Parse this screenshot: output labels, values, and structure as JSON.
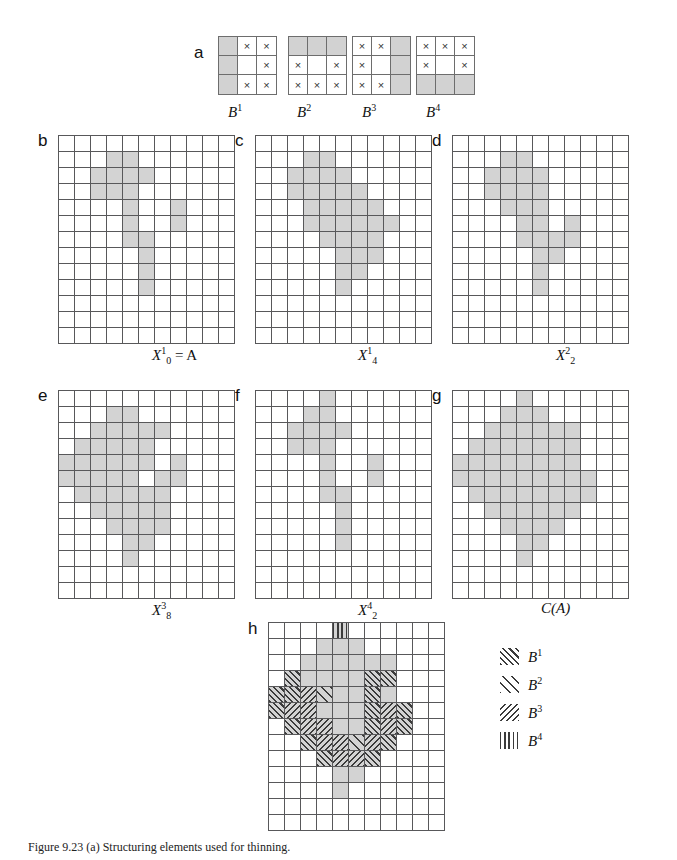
{
  "figure": {
    "caption": "Figure 9.23  (a) Structuring elements used for thinning.",
    "grid": {
      "cols": 11,
      "rows": 13,
      "fill_color": "#d3d3d3",
      "line_color": "#58585a"
    }
  },
  "structuring_elements": {
    "panel_letter": "a",
    "items": [
      {
        "label": "B",
        "sup": "1",
        "cells": [
          "g",
          "x",
          "x",
          "g",
          "",
          "x",
          "g",
          "x",
          "x"
        ]
      },
      {
        "label": "B",
        "sup": "2",
        "cells": [
          "g",
          "g",
          "g",
          "x",
          "",
          "x",
          "x",
          "x",
          "x"
        ]
      },
      {
        "label": "B",
        "sup": "3",
        "cells": [
          "x",
          "x",
          "g",
          "x",
          "",
          "g",
          "x",
          "x",
          "g"
        ]
      },
      {
        "label": "B",
        "sup": "4",
        "cells": [
          "x",
          "x",
          "x",
          "x",
          "",
          "x",
          "g",
          "g",
          "g"
        ]
      }
    ],
    "mark_glyph": "×"
  },
  "panels": [
    {
      "id": "b",
      "letter": "b",
      "caption_parts": {
        "base": "X",
        "sub": "0",
        "sup": "1",
        "tail": " = A"
      },
      "filled": [
        [
          3,
          1
        ],
        [
          4,
          1
        ],
        [
          2,
          2
        ],
        [
          3,
          2
        ],
        [
          4,
          2
        ],
        [
          5,
          2
        ],
        [
          2,
          3
        ],
        [
          3,
          3
        ],
        [
          4,
          3
        ],
        [
          4,
          4
        ],
        [
          7,
          4
        ],
        [
          4,
          5
        ],
        [
          7,
          5
        ],
        [
          4,
          6
        ],
        [
          5,
          6
        ],
        [
          5,
          7
        ],
        [
          5,
          8
        ],
        [
          5,
          9
        ]
      ]
    },
    {
      "id": "c",
      "letter": "c",
      "caption_parts": {
        "base": "X",
        "sub": "4",
        "sup": "1",
        "tail": ""
      },
      "filled": [
        [
          3,
          1
        ],
        [
          4,
          1
        ],
        [
          2,
          2
        ],
        [
          3,
          2
        ],
        [
          4,
          2
        ],
        [
          5,
          2
        ],
        [
          2,
          3
        ],
        [
          3,
          3
        ],
        [
          4,
          3
        ],
        [
          5,
          3
        ],
        [
          6,
          3
        ],
        [
          3,
          4
        ],
        [
          4,
          4
        ],
        [
          5,
          4
        ],
        [
          6,
          4
        ],
        [
          7,
          4
        ],
        [
          3,
          5
        ],
        [
          4,
          5
        ],
        [
          5,
          5
        ],
        [
          6,
          5
        ],
        [
          7,
          5
        ],
        [
          8,
          5
        ],
        [
          4,
          6
        ],
        [
          5,
          6
        ],
        [
          6,
          6
        ],
        [
          7,
          6
        ],
        [
          5,
          7
        ],
        [
          6,
          7
        ],
        [
          7,
          7
        ],
        [
          5,
          8
        ],
        [
          6,
          8
        ],
        [
          5,
          9
        ]
      ]
    },
    {
      "id": "d",
      "letter": "d",
      "caption_parts": {
        "base": "X",
        "sub": "2",
        "sup": "2",
        "tail": ""
      },
      "filled": [
        [
          3,
          1
        ],
        [
          4,
          1
        ],
        [
          2,
          2
        ],
        [
          3,
          2
        ],
        [
          4,
          2
        ],
        [
          5,
          2
        ],
        [
          2,
          3
        ],
        [
          3,
          3
        ],
        [
          4,
          3
        ],
        [
          5,
          3
        ],
        [
          3,
          4
        ],
        [
          4,
          4
        ],
        [
          5,
          4
        ],
        [
          4,
          5
        ],
        [
          5,
          5
        ],
        [
          7,
          5
        ],
        [
          4,
          6
        ],
        [
          5,
          6
        ],
        [
          6,
          6
        ],
        [
          7,
          6
        ],
        [
          5,
          7
        ],
        [
          6,
          7
        ],
        [
          5,
          8
        ],
        [
          5,
          9
        ]
      ]
    },
    {
      "id": "e",
      "letter": "e",
      "caption_parts": {
        "base": "X",
        "sub": "8",
        "sup": "3",
        "tail": ""
      },
      "filled": [
        [
          3,
          1
        ],
        [
          4,
          1
        ],
        [
          2,
          2
        ],
        [
          3,
          2
        ],
        [
          4,
          2
        ],
        [
          5,
          2
        ],
        [
          6,
          2
        ],
        [
          1,
          3
        ],
        [
          2,
          3
        ],
        [
          3,
          3
        ],
        [
          4,
          3
        ],
        [
          5,
          3
        ],
        [
          0,
          4
        ],
        [
          1,
          4
        ],
        [
          2,
          4
        ],
        [
          3,
          4
        ],
        [
          4,
          4
        ],
        [
          5,
          4
        ],
        [
          7,
          4
        ],
        [
          0,
          5
        ],
        [
          1,
          5
        ],
        [
          2,
          5
        ],
        [
          3,
          5
        ],
        [
          4,
          5
        ],
        [
          6,
          5
        ],
        [
          7,
          5
        ],
        [
          1,
          6
        ],
        [
          2,
          6
        ],
        [
          3,
          6
        ],
        [
          4,
          6
        ],
        [
          5,
          6
        ],
        [
          6,
          6
        ],
        [
          2,
          7
        ],
        [
          3,
          7
        ],
        [
          4,
          7
        ],
        [
          5,
          7
        ],
        [
          6,
          7
        ],
        [
          3,
          8
        ],
        [
          4,
          8
        ],
        [
          5,
          8
        ],
        [
          6,
          8
        ],
        [
          4,
          9
        ],
        [
          5,
          9
        ],
        [
          4,
          10
        ]
      ]
    },
    {
      "id": "f",
      "letter": "f",
      "caption_parts": {
        "base": "X",
        "sub": "2",
        "sup": "4",
        "tail": ""
      },
      "filled": [
        [
          4,
          0
        ],
        [
          3,
          1
        ],
        [
          4,
          1
        ],
        [
          2,
          2
        ],
        [
          3,
          2
        ],
        [
          4,
          2
        ],
        [
          5,
          2
        ],
        [
          2,
          3
        ],
        [
          3,
          3
        ],
        [
          4,
          3
        ],
        [
          4,
          4
        ],
        [
          7,
          4
        ],
        [
          4,
          5
        ],
        [
          7,
          5
        ],
        [
          4,
          6
        ],
        [
          5,
          6
        ],
        [
          5,
          7
        ],
        [
          5,
          8
        ],
        [
          5,
          9
        ]
      ]
    },
    {
      "id": "g",
      "letter": "g",
      "caption_parts": {
        "base": "C(A)",
        "sub": "",
        "sup": "",
        "tail": ""
      },
      "filled": [
        [
          4,
          0
        ],
        [
          3,
          1
        ],
        [
          4,
          1
        ],
        [
          5,
          1
        ],
        [
          2,
          2
        ],
        [
          3,
          2
        ],
        [
          4,
          2
        ],
        [
          5,
          2
        ],
        [
          6,
          2
        ],
        [
          7,
          2
        ],
        [
          1,
          3
        ],
        [
          2,
          3
        ],
        [
          3,
          3
        ],
        [
          4,
          3
        ],
        [
          5,
          3
        ],
        [
          6,
          3
        ],
        [
          7,
          3
        ],
        [
          0,
          4
        ],
        [
          1,
          4
        ],
        [
          2,
          4
        ],
        [
          3,
          4
        ],
        [
          4,
          4
        ],
        [
          5,
          4
        ],
        [
          6,
          4
        ],
        [
          7,
          4
        ],
        [
          0,
          5
        ],
        [
          1,
          5
        ],
        [
          2,
          5
        ],
        [
          3,
          5
        ],
        [
          4,
          5
        ],
        [
          5,
          5
        ],
        [
          6,
          5
        ],
        [
          7,
          5
        ],
        [
          8,
          5
        ],
        [
          1,
          6
        ],
        [
          2,
          6
        ],
        [
          3,
          6
        ],
        [
          4,
          6
        ],
        [
          5,
          6
        ],
        [
          6,
          6
        ],
        [
          7,
          6
        ],
        [
          8,
          6
        ],
        [
          2,
          7
        ],
        [
          3,
          7
        ],
        [
          4,
          7
        ],
        [
          5,
          7
        ],
        [
          6,
          7
        ],
        [
          7,
          7
        ],
        [
          3,
          8
        ],
        [
          4,
          8
        ],
        [
          5,
          8
        ],
        [
          6,
          8
        ],
        [
          4,
          9
        ],
        [
          5,
          9
        ],
        [
          4,
          10
        ]
      ]
    }
  ],
  "panel_h": {
    "letter": "h",
    "filled": [
      [
        4,
        0
      ],
      [
        3,
        1
      ],
      [
        4,
        1
      ],
      [
        5,
        1
      ],
      [
        2,
        2
      ],
      [
        3,
        2
      ],
      [
        4,
        2
      ],
      [
        5,
        2
      ],
      [
        6,
        2
      ],
      [
        7,
        2
      ],
      [
        1,
        3
      ],
      [
        2,
        3
      ],
      [
        3,
        3
      ],
      [
        4,
        3
      ],
      [
        5,
        3
      ],
      [
        6,
        3
      ],
      [
        7,
        3
      ],
      [
        0,
        4
      ],
      [
        1,
        4
      ],
      [
        2,
        4
      ],
      [
        3,
        4
      ],
      [
        4,
        4
      ],
      [
        5,
        4
      ],
      [
        6,
        4
      ],
      [
        7,
        4
      ],
      [
        0,
        5
      ],
      [
        1,
        5
      ],
      [
        2,
        5
      ],
      [
        3,
        5
      ],
      [
        4,
        5
      ],
      [
        5,
        5
      ],
      [
        6,
        5
      ],
      [
        7,
        5
      ],
      [
        8,
        5
      ],
      [
        1,
        6
      ],
      [
        2,
        6
      ],
      [
        3,
        6
      ],
      [
        4,
        6
      ],
      [
        5,
        6
      ],
      [
        6,
        6
      ],
      [
        7,
        6
      ],
      [
        8,
        6
      ],
      [
        2,
        7
      ],
      [
        3,
        7
      ],
      [
        4,
        7
      ],
      [
        5,
        7
      ],
      [
        6,
        7
      ],
      [
        7,
        7
      ],
      [
        3,
        8
      ],
      [
        4,
        8
      ],
      [
        5,
        8
      ],
      [
        6,
        8
      ],
      [
        4,
        9
      ],
      [
        5,
        9
      ],
      [
        4,
        10
      ]
    ],
    "hatch": {
      "h1": [
        [
          1,
          3
        ],
        [
          6,
          3
        ],
        [
          7,
          3
        ],
        [
          0,
          4
        ],
        [
          1,
          4
        ],
        [
          2,
          4
        ],
        [
          6,
          4
        ],
        [
          0,
          5
        ],
        [
          1,
          5
        ],
        [
          2,
          5
        ],
        [
          6,
          5
        ],
        [
          7,
          5
        ],
        [
          8,
          5
        ],
        [
          1,
          6
        ],
        [
          2,
          6
        ],
        [
          3,
          6
        ],
        [
          6,
          6
        ],
        [
          7,
          6
        ],
        [
          8,
          6
        ],
        [
          2,
          7
        ],
        [
          3,
          7
        ],
        [
          4,
          7
        ],
        [
          6,
          7
        ],
        [
          7,
          7
        ],
        [
          3,
          8
        ],
        [
          4,
          8
        ],
        [
          5,
          8
        ],
        [
          6,
          8
        ]
      ],
      "h2": [
        [
          3,
          4
        ],
        [
          5,
          7
        ]
      ],
      "h3": [
        [
          2,
          4
        ],
        [
          1,
          5
        ],
        [
          2,
          5
        ],
        [
          7,
          5
        ],
        [
          2,
          6
        ],
        [
          3,
          6
        ],
        [
          7,
          6
        ],
        [
          3,
          7
        ],
        [
          4,
          7
        ],
        [
          6,
          7
        ],
        [
          4,
          8
        ],
        [
          5,
          8
        ]
      ],
      "h4": [
        [
          4,
          0
        ]
      ]
    },
    "legend": [
      {
        "pattern": "h1",
        "label": "B",
        "sup": "1"
      },
      {
        "pattern": "h2",
        "label": "B",
        "sup": "2"
      },
      {
        "pattern": "h3",
        "label": "B",
        "sup": "3"
      },
      {
        "pattern": "h4",
        "label": "B",
        "sup": "4"
      }
    ]
  }
}
